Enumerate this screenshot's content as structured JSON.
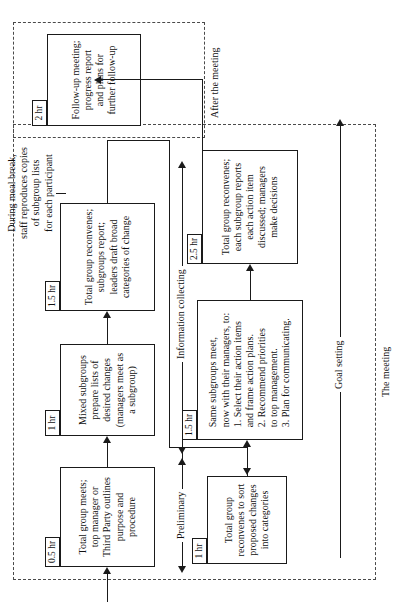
{
  "figure": {
    "orientation": "rotated-90-ccw",
    "ink_color": "#1a1a1a",
    "dash_color": "#4a4a4a",
    "background": "#ffffff"
  },
  "steps": [
    {
      "id": "step-1",
      "duration": "0.5 hr",
      "text": "Total group meets;\ntop manager or\nThird Party outlines\npurpose and procedure"
    },
    {
      "id": "step-2",
      "duration": "1 hr",
      "text": "Mixed subgroups\nprepare lists of\ndesired changes\n(managers meet as\na subgroup)"
    },
    {
      "id": "step-3",
      "duration": "1.5 hr",
      "text": "Total group reconvenes;\nsubgroups report;\nleaders draft broad\ncategories of change"
    },
    {
      "id": "step-4",
      "duration": "1 hr",
      "text": "Total group\nreconvenes to sort\nproposed changes\ninto categories"
    },
    {
      "id": "step-5",
      "duration": "1.5 hr",
      "text": "Same subgroups meet,\nnow with their managers, to:\n1. Select their action items\n    and frame action plans.\n2. Recommend priorities\n    to top management.\n3. Plan for communicating."
    },
    {
      "id": "step-6",
      "duration": "2.5 hr",
      "text": "Total group reconvenes;\neach subgroup reports\neach action item\ndiscussed; managers\nmake decisions"
    },
    {
      "id": "step-7",
      "duration": "2 hr",
      "text": "Follow-up meeting;\nprogress report\nand plans for\nfurther follow-up"
    }
  ],
  "annotations": {
    "meal_break": "During meal break,\nstaff reproduces copies\nof subgroup lists\nfor each participant"
  },
  "phase_labels": {
    "preliminary": "Preliminary",
    "information_collecting": "Information collecting",
    "goal_setting": "Goal setting"
  },
  "region_captions": {
    "the_meeting": "The meeting",
    "after_the_meeting": "After the meeting"
  }
}
